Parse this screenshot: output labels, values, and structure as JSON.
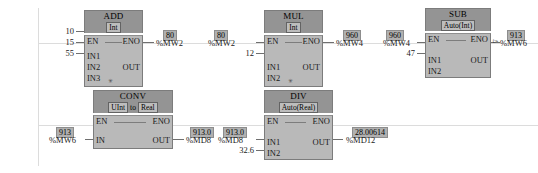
{
  "editor": {
    "kind": "ladder-logic-network",
    "background": "#ffffff",
    "rail_color": "#dcdcdc",
    "block_header_color": "#949494",
    "block_body_color": "#b9b9b9",
    "badge_color": "#b0b0b0"
  },
  "blocks": [
    {
      "id": "add",
      "title": "ADD",
      "type_badge": "Int",
      "type_prefix": "",
      "type_word": "",
      "type_suffix": "",
      "en_label": "EN",
      "eno_label": "ENO",
      "inputs": [
        {
          "pin": "IN1",
          "value": "10"
        },
        {
          "pin": "IN2",
          "value": "15"
        },
        {
          "pin": "IN3",
          "value": "55"
        }
      ],
      "expand_marker": "✳",
      "output": {
        "pin": "OUT",
        "value": "80",
        "tag": "%MW2"
      }
    },
    {
      "id": "mul",
      "title": "MUL",
      "type_badge": "Int",
      "en_label": "EN",
      "eno_label": "ENO",
      "inputs": [
        {
          "pin": "IN1",
          "value": "80",
          "tag": "%MW2"
        },
        {
          "pin": "IN2",
          "value": "12"
        }
      ],
      "expand_marker": "✳",
      "output": {
        "pin": "OUT",
        "value": "960",
        "tag": "%MW4"
      }
    },
    {
      "id": "sub",
      "title": "SUB",
      "type_badge": "Auto(Int)",
      "en_label": "EN",
      "eno_label": "ENO",
      "inputs": [
        {
          "pin": "IN1",
          "value": "960",
          "tag": "%MW4"
        },
        {
          "pin": "IN2",
          "value": "47"
        }
      ],
      "output": {
        "pin": "OUT",
        "value": "913",
        "tag": "%MW6"
      }
    },
    {
      "id": "conv",
      "title": "CONV",
      "type_badge_from": "UInt",
      "type_word": "to",
      "type_badge_to": "Real",
      "en_label": "EN",
      "eno_label": "ENO",
      "inputs": [
        {
          "pin": "IN",
          "value": "913",
          "tag": "%MW6"
        }
      ],
      "output": {
        "pin": "OUT",
        "value": "913.0",
        "tag": "%MD8"
      }
    },
    {
      "id": "div",
      "title": "DIV",
      "type_badge": "Auto(Real)",
      "en_label": "EN",
      "eno_label": "ENO",
      "inputs": [
        {
          "pin": "IN1",
          "value": "913.0",
          "tag": "%MD8"
        },
        {
          "pin": "IN2",
          "value": "32.6"
        }
      ],
      "output": {
        "pin": "OUT",
        "value": "28.00614",
        "tag": "%MD12"
      }
    }
  ]
}
